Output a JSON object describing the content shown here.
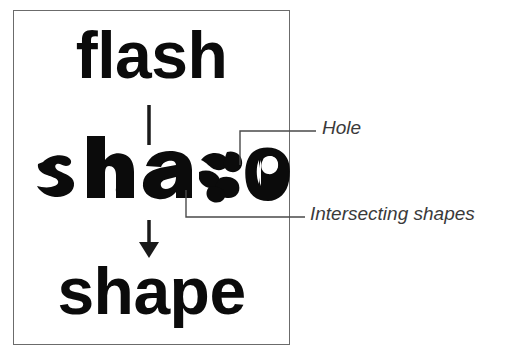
{
  "diagram": {
    "frame": {
      "border_color": "#6b6b6b",
      "background": "#ffffff"
    },
    "source_word": "flash",
    "result_word": "shape",
    "intermediate_word": "shapen",
    "text_color": "#0b0b0b",
    "arrow": {
      "direction": "down",
      "color": "#1a1a1a"
    },
    "callouts": [
      {
        "id": "hole",
        "label": "Hole",
        "target": "counter-of-n-glyph",
        "leader_color": "#4a4a4a"
      },
      {
        "id": "intersecting-shapes",
        "label": "Intersecting shapes",
        "target": "overlapping-e-glyph-fragments",
        "leader_color": "#4a4a4a"
      }
    ],
    "label_color": "#3a3a3a"
  }
}
